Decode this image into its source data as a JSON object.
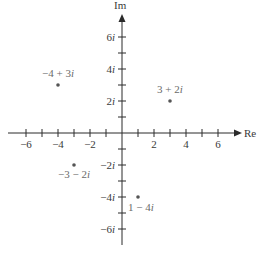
{
  "diagram": {
    "type": "complex-plane",
    "x_axis_label": "Re",
    "y_axis_label": "Im",
    "x_ticks": [
      {
        "value": -6,
        "label": "−6"
      },
      {
        "value": -5,
        "label": ""
      },
      {
        "value": -4,
        "label": "−4"
      },
      {
        "value": -3,
        "label": ""
      },
      {
        "value": -2,
        "label": "−2"
      },
      {
        "value": -1,
        "label": ""
      },
      {
        "value": 1,
        "label": ""
      },
      {
        "value": 2,
        "label": "2"
      },
      {
        "value": 3,
        "label": ""
      },
      {
        "value": 4,
        "label": "4"
      },
      {
        "value": 5,
        "label": ""
      },
      {
        "value": 6,
        "label": "6"
      }
    ],
    "y_ticks": [
      {
        "value": 6,
        "label": "6i"
      },
      {
        "value": 5,
        "label": ""
      },
      {
        "value": 4,
        "label": "4i"
      },
      {
        "value": 3,
        "label": ""
      },
      {
        "value": 2,
        "label": "2i"
      },
      {
        "value": 1,
        "label": ""
      },
      {
        "value": -1,
        "label": ""
      },
      {
        "value": -2,
        "label": "−2i"
      },
      {
        "value": -3,
        "label": ""
      },
      {
        "value": -4,
        "label": "−4i"
      },
      {
        "value": -5,
        "label": ""
      },
      {
        "value": -6,
        "label": "−6i"
      }
    ],
    "points": [
      {
        "re": -4,
        "im": 3,
        "label": "−4 + 3i",
        "label_pos": "above"
      },
      {
        "re": 3,
        "im": 2,
        "label": "3 + 2i",
        "label_pos": "above"
      },
      {
        "re": -3,
        "im": -2,
        "label": "−3 − 2i",
        "label_pos": "below"
      },
      {
        "re": 1,
        "im": -4,
        "label": "1 − 4i",
        "label_pos": "below-right"
      }
    ],
    "colors": {
      "axis": "#2a2a2a",
      "point": "#555555",
      "point_label": "#6a6a6a"
    }
  }
}
